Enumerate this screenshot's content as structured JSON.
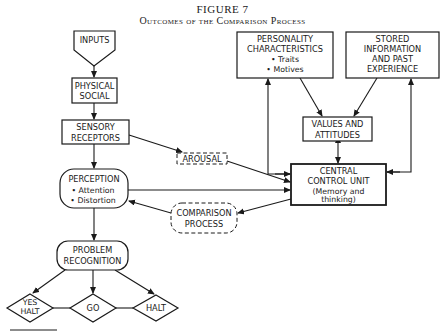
{
  "figure": {
    "title": "FIGURE 7",
    "subtitle": "Outcomes of the Comparison Process"
  },
  "nodes": {
    "inputs": {
      "label": "INPUTS"
    },
    "physical_social": {
      "lines": [
        "PHYSICAL",
        "SOCIAL"
      ]
    },
    "sensory_receptors": {
      "lines": [
        "SENSORY",
        "RECEPTORS"
      ]
    },
    "perception": {
      "lines": [
        "PERCEPTION",
        "• Attention",
        "• Distortion"
      ]
    },
    "problem_recognition": {
      "lines": [
        "PROBLEM",
        "RECOGNITION"
      ]
    },
    "yes_halt": {
      "lines": [
        "YES",
        "HALT"
      ]
    },
    "go": {
      "label": "GO"
    },
    "halt": {
      "label": "HALT"
    },
    "arousal": {
      "label": "AROUSAL"
    },
    "comparison_process": {
      "lines": [
        "COMPARISON",
        "PROCESS"
      ]
    },
    "personality": {
      "lines": [
        "PERSONALITY",
        "CHARACTERISTICS",
        "• Traits",
        "• Motives"
      ]
    },
    "stored_information": {
      "lines": [
        "STORED",
        "INFORMATION",
        "AND PAST",
        "EXPERIENCE"
      ]
    },
    "values_attitudes": {
      "lines": [
        "VALUES AND",
        "ATTITUDES"
      ]
    },
    "central_control": {
      "lines": [
        "CENTRAL",
        "CONTROL UNIT",
        "(Memory and",
        "thinking)"
      ]
    }
  },
  "edges": [
    {
      "from": "INPUTS",
      "to": "PHYSICAL SOCIAL"
    },
    {
      "from": "PHYSICAL SOCIAL",
      "to": "SENSORY RECEPTORS"
    },
    {
      "from": "SENSORY RECEPTORS",
      "to": "PERCEPTION"
    },
    {
      "from": "SENSORY RECEPTORS",
      "to": "AROUSAL"
    },
    {
      "from": "AROUSAL",
      "to": "CENTRAL CONTROL UNIT"
    },
    {
      "from": "PERCEPTION",
      "to": "CENTRAL CONTROL UNIT"
    },
    {
      "from": "CENTRAL CONTROL UNIT",
      "to": "COMPARISON PROCESS"
    },
    {
      "from": "COMPARISON PROCESS",
      "to": "PERCEPTION"
    },
    {
      "from": "PERCEPTION",
      "to": "PROBLEM RECOGNITION"
    },
    {
      "from": "PROBLEM RECOGNITION",
      "to": "YES HALT"
    },
    {
      "from": "PROBLEM RECOGNITION",
      "to": "GO"
    },
    {
      "from": "PROBLEM RECOGNITION",
      "to": "HALT"
    },
    {
      "from": "PERSONALITY CHARACTERISTICS",
      "to": "VALUES AND ATTITUDES"
    },
    {
      "from": "STORED INFORMATION AND PAST EXPERIENCE",
      "to": "VALUES AND ATTITUDES"
    },
    {
      "from": "VALUES AND ATTITUDES",
      "to": "CENTRAL CONTROL UNIT",
      "bidirectional": true
    },
    {
      "from": "CENTRAL CONTROL UNIT",
      "to": "PERSONALITY CHARACTERISTICS",
      "bidirectional": true
    },
    {
      "from": "CENTRAL CONTROL UNIT",
      "to": "STORED INFORMATION AND PAST EXPERIENCE",
      "bidirectional": true
    }
  ]
}
